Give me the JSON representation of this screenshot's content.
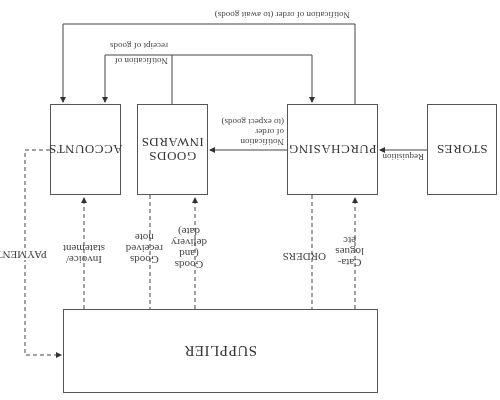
{
  "diagram": {
    "orientation": "rotated 180 degrees",
    "nodes": {
      "stores": "STORES",
      "purchasing": "PURCHASING",
      "goods_inwards": "GOODS\nINWARDS",
      "accounts": "ACCOUNTS",
      "supplier": "SUPPLIER"
    },
    "edges": {
      "requisition": "Requisition",
      "notify_expect": "Notification\nof order\n(to expect goods)",
      "notify_await": "Notification of order (to await goods)",
      "notify_receipt_1": "Notification of",
      "notify_receipt_2": "receipt of goods",
      "orders": "ORDERS",
      "catalogues": "Cata-\nlogues\netc",
      "goods_delivery": "Goods\n(and\ndelivery\ndate)",
      "goods_received_note": "Goods\nreceived\nnote",
      "invoice": "Invoice/\nstatement",
      "payment": "PAYMENT"
    }
  }
}
